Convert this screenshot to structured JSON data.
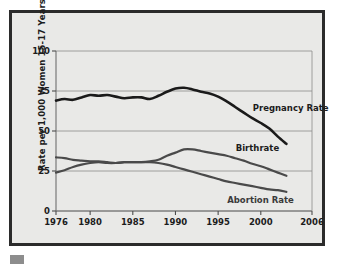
{
  "figure": {
    "ylabel": "Rate per 1,000 Women 15-17 Years",
    "background_color": "#e9e9e7",
    "frame_color": "#2b2b2b",
    "footer_swatch_color": "#8d8d8d"
  },
  "chart_data": {
    "type": "line",
    "title": "",
    "xlabel": "",
    "ylabel": "Rate per 1,000 Women 15-17 Years",
    "xlim": [
      1976,
      2006
    ],
    "ylim": [
      0,
      100
    ],
    "xticks": [
      "1976",
      "1980",
      "1985",
      "1990",
      "1995",
      "2000",
      "2006"
    ],
    "xtick_values": [
      1976,
      1980,
      1985,
      1990,
      1995,
      2000,
      2006
    ],
    "yticks": [
      "0",
      "25",
      "50",
      "75",
      "100"
    ],
    "ytick_values": [
      0,
      25,
      50,
      75,
      100
    ],
    "grid": "horizontal",
    "legend_position": "inline-annotations",
    "x": [
      1976,
      1977,
      1978,
      1979,
      1980,
      1981,
      1982,
      1983,
      1984,
      1985,
      1986,
      1987,
      1988,
      1989,
      1990,
      1991,
      1992,
      1993,
      1994,
      1995,
      1996,
      1997,
      1998,
      1999,
      2000,
      2001,
      2002,
      2003
    ],
    "series": [
      {
        "name": "Pregnancy Rate",
        "color": "#1a1a1a",
        "label_x": 2000,
        "label_y": 64,
        "values": [
          69,
          70,
          69.5,
          71,
          72.5,
          72,
          72.5,
          71.5,
          70.5,
          71,
          71,
          70,
          72,
          74.5,
          76.5,
          77,
          76,
          74.5,
          73.5,
          71.5,
          68.5,
          65,
          61.5,
          58,
          55,
          51.5,
          46.5,
          42
        ]
      },
      {
        "name": "Birthrate",
        "color": "#4a4a4a",
        "label_x": 1998,
        "label_y": 39,
        "values": [
          24,
          25.5,
          27.5,
          29,
          30,
          30.5,
          30,
          30,
          30.5,
          30.5,
          30.5,
          31,
          32,
          34.5,
          36.5,
          38.5,
          38.5,
          37.5,
          36.5,
          35.5,
          34.5,
          33,
          31.5,
          29.5,
          28,
          26,
          24,
          22
        ]
      },
      {
        "name": "Abortion Rate",
        "color": "#4a4a4a",
        "label_x": 1997,
        "label_y": 6,
        "values": [
          33.5,
          33,
          32,
          31.5,
          31,
          31,
          30.5,
          30,
          30.5,
          30.5,
          30.5,
          30.5,
          30,
          29,
          27.5,
          26,
          24.5,
          23,
          21.5,
          20,
          18.5,
          17.5,
          16.5,
          15.5,
          14.5,
          13.5,
          13,
          12
        ]
      }
    ]
  }
}
